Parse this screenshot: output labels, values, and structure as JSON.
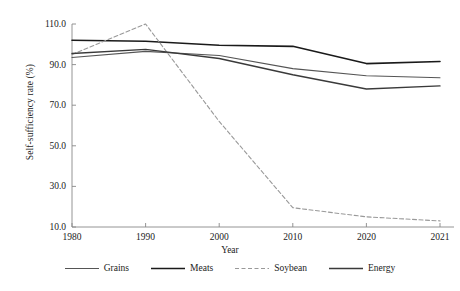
{
  "chart_data": {
    "type": "line",
    "title": "",
    "xlabel": "Year",
    "ylabel": "Self-sufficiency rate (%)",
    "x": [
      1980,
      1990,
      2000,
      2010,
      2020,
      2021
    ],
    "xtick_labels": [
      "1980",
      "1990",
      "2000",
      "2010",
      "2020",
      "2021"
    ],
    "ytick_labels": [
      "110.0",
      "90.0",
      "70.0",
      "50.0",
      "30.0",
      "10.0"
    ],
    "ytick_values": [
      110.0,
      90.0,
      70.0,
      50.0,
      30.0,
      10.0
    ],
    "xlim": [
      1980,
      2021
    ],
    "ylim": [
      10.0,
      110.0
    ],
    "grid": false,
    "legend_position": "bottom",
    "series": [
      {
        "name": "Grains",
        "style": "solid",
        "color": "#555555",
        "width": 1.1,
        "values": [
          93.5,
          96.5,
          94.5,
          88.0,
          84.5,
          83.5
        ]
      },
      {
        "name": "Meats",
        "style": "solid",
        "color": "#1a1a1a",
        "width": 1.6,
        "values": [
          102.0,
          101.5,
          99.5,
          99.0,
          90.5,
          91.5
        ]
      },
      {
        "name": "Soybean",
        "style": "dashed",
        "color": "#999999",
        "width": 1.1,
        "values": [
          95.0,
          110.0,
          62.0,
          19.5,
          15.0,
          13.0
        ]
      },
      {
        "name": "Energy",
        "style": "solid",
        "color": "#3a3a3a",
        "width": 1.4,
        "values": [
          95.5,
          97.5,
          93.0,
          85.0,
          78.0,
          79.5
        ]
      }
    ]
  },
  "legend": {
    "items": [
      {
        "label": "Grains"
      },
      {
        "label": "Meats"
      },
      {
        "label": "Soybean"
      },
      {
        "label": "Energy"
      }
    ]
  }
}
